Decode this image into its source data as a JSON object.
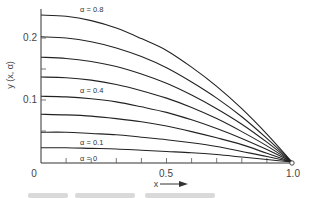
{
  "chart_data": {
    "type": "line",
    "title": "",
    "xlabel": "x",
    "ylabel": "y (x, α)",
    "xlim": [
      0,
      1.0
    ],
    "ylim": [
      0,
      0.25
    ],
    "grid": false,
    "legend": "inline labels",
    "x_ticks": [
      0,
      0.1,
      0.2,
      0.3,
      0.4,
      0.5,
      0.6,
      0.7,
      0.8,
      0.9,
      1.0
    ],
    "x_tick_labels": [
      {
        "value": 0,
        "label": "0"
      },
      {
        "value": 0.5,
        "label": "0.5"
      },
      {
        "value": 1.0,
        "label": "1.0"
      }
    ],
    "y_ticks": [
      0,
      0.05,
      0.1,
      0.15,
      0.2
    ],
    "y_tick_labels": [
      {
        "value": 0,
        "label": "0"
      },
      {
        "value": 0.1,
        "label": "0.1"
      },
      {
        "value": 0.2,
        "label": "0.2"
      }
    ],
    "x": [
      0,
      0.1,
      0.2,
      0.3,
      0.4,
      0.5,
      0.6,
      0.7,
      0.8,
      0.9,
      1.0
    ],
    "series": [
      {
        "name": "α = 0",
        "values": [
          0,
          0,
          0,
          0,
          0,
          0,
          0,
          0,
          0,
          0,
          0
        ]
      },
      {
        "name": "α = 0.1",
        "values": [
          0.023,
          0.023,
          0.022,
          0.021,
          0.019,
          0.017,
          0.015,
          0.012,
          0.008,
          0.004,
          0
        ]
      },
      {
        "name": "α = 0.2",
        "values": [
          0.048,
          0.048,
          0.046,
          0.044,
          0.04,
          0.036,
          0.031,
          0.025,
          0.017,
          0.009,
          0
        ]
      },
      {
        "name": "α = 0.3",
        "values": [
          0.077,
          0.076,
          0.074,
          0.07,
          0.065,
          0.058,
          0.049,
          0.039,
          0.028,
          0.014,
          0
        ]
      },
      {
        "name": "α = 0.4",
        "values": [
          0.106,
          0.105,
          0.102,
          0.097,
          0.089,
          0.08,
          0.068,
          0.054,
          0.038,
          0.02,
          0
        ]
      },
      {
        "name": "α = 0.5",
        "values": [
          0.137,
          0.136,
          0.132,
          0.125,
          0.115,
          0.103,
          0.088,
          0.07,
          0.049,
          0.026,
          0
        ]
      },
      {
        "name": "α = 0.6",
        "values": [
          0.169,
          0.167,
          0.162,
          0.154,
          0.142,
          0.127,
          0.108,
          0.086,
          0.061,
          0.032,
          0
        ]
      },
      {
        "name": "α = 0.7",
        "values": [
          0.202,
          0.2,
          0.194,
          0.184,
          0.17,
          0.152,
          0.129,
          0.103,
          0.073,
          0.038,
          0
        ]
      },
      {
        "name": "α = 0.8",
        "values": [
          0.237,
          0.235,
          0.228,
          0.216,
          0.199,
          0.18,
          0.153,
          0.122,
          0.086,
          0.045,
          0
        ]
      }
    ],
    "annotations": [
      {
        "text": "α = 0.8",
        "series": "α = 0.8",
        "x": 0.33
      },
      {
        "text": "α = 0.4",
        "series": "α = 0.4",
        "x": 0.33
      },
      {
        "text": "α = 0.1",
        "series": "α = 0.1",
        "x": 0.33
      },
      {
        "text": "α = 0",
        "series": "α = 0",
        "x": 0.33
      }
    ],
    "endpoint_marker": {
      "x": 1.0,
      "y": 0,
      "shape": "open-circle"
    }
  },
  "labels": {
    "y_axis_title": "y (x, α)",
    "x_axis_title": "x",
    "tick_0": "0",
    "tick_x_05": "0.5",
    "tick_x_10": "1.0",
    "tick_y_01": "0.1",
    "tick_y_02": "0.2",
    "alpha_08": "α = 0.8",
    "alpha_04": "α = 0.4",
    "alpha_01": "α = 0.1",
    "alpha_0": "α = 0"
  }
}
